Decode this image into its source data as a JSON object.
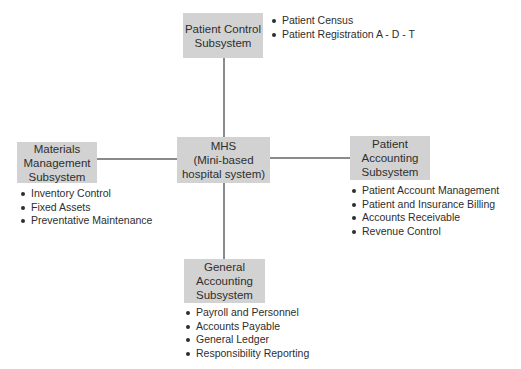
{
  "diagram": {
    "center": {
      "label": "MHS\n(Mini-based\nhospital system)"
    },
    "subsystems": {
      "patient_control": {
        "label": "Patient Control\nSubsystem",
        "items": [
          "Patient Census",
          "Patient Registration A - D - T"
        ]
      },
      "materials_management": {
        "label": "Materials\nManagement\nSubsystem",
        "items": [
          "Inventory Control",
          "Fixed Assets",
          "Preventative Maintenance"
        ]
      },
      "patient_accounting": {
        "label": "Patient\nAccounting\nSubsystem",
        "items": [
          "Patient Account Management",
          "Patient and Insurance Billing",
          "Accounts Receivable",
          "Revenue Control"
        ]
      },
      "general_accounting": {
        "label": "General\nAccounting\nSubsystem",
        "items": [
          "Payroll and Personnel",
          "Accounts Payable",
          "General Ledger",
          "Responsibility Reporting"
        ]
      }
    },
    "colors": {
      "box_fill": "#d2d2d2",
      "connector": "#8a8a8a",
      "text": "#2e2e2e"
    }
  }
}
